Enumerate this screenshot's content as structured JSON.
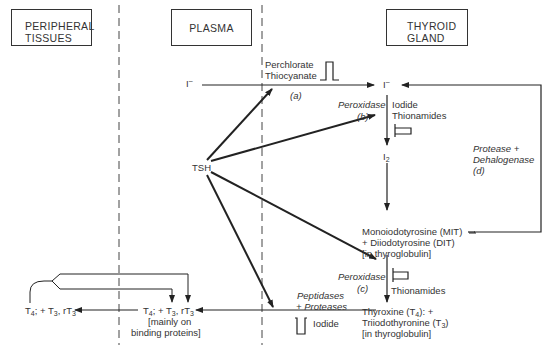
{
  "compartments": {
    "peripheral": {
      "line1": "PERIPHERAL",
      "line2": "TISSUES"
    },
    "plasma": {
      "label": "PLASMA"
    },
    "thyroid": {
      "line1": "THYROID",
      "line2": "GLAND"
    }
  },
  "nodes": {
    "iodide_plasma": "I",
    "iodide_plasma_sup": "–",
    "iodide_thyroid": "I",
    "iodide_thyroid_sup": "–",
    "i2": "I",
    "i2_sub": "2",
    "tsh": "TSH",
    "mit_line1": "Monoiodotyrosine (MIT)",
    "mit_line2": "+ Diiodotyrosine (DIT)",
    "mit_line3": "[in thyroglobulin]",
    "t4_line1_a": "Thyroxine (T",
    "t4_line1_sub": "4",
    "t4_line1_b": "): +",
    "t4_line2_a": "Triiodothyronine (T",
    "t4_line2_sub": "3",
    "t4_line2_b": ")",
    "t4_line3": "[in thyroglobulin]",
    "plasma_hormones": {
      "t": "T",
      "s4": "4",
      "mid": "; + T",
      "s3": "3",
      "r": ", rT",
      "s3b": "3"
    },
    "plasma_hormones_note1": "[mainly on",
    "plasma_hormones_note2": "binding proteins]",
    "peripheral_hormones": {
      "t": "T",
      "s4": "4",
      "mid": "; + T",
      "s3": "3",
      "r": ", rT",
      "s3b": "3"
    }
  },
  "enzymes": {
    "a_line1": "Perchlorate",
    "a_line2": "Thiocyanate",
    "a_tag": "(a)",
    "b_name": "Peroxidase",
    "b_tag": "(b)",
    "b_inhib1": "Iodide",
    "b_inhib2": "Thionamides",
    "c_name": "Peroxidase",
    "c_tag": "(c)",
    "c_inhib": "Thionamides",
    "d_line1": "Protease +",
    "d_line2": "Dehalogenase",
    "d_tag": "(d)",
    "release_line1": "Peptidases",
    "release_line2": "+ Proteases",
    "release_inhib": "Iodide"
  },
  "colors": {
    "line": "#222222",
    "dash": "#444444",
    "text": "#333333"
  }
}
